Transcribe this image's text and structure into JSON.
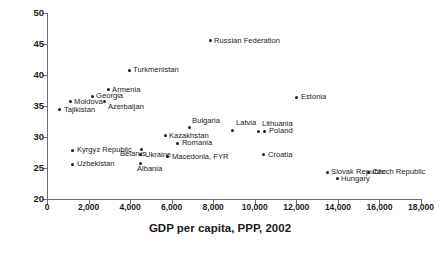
{
  "chart_data": {
    "type": "scatter",
    "title": "",
    "xlabel": "GDP per capita, PPP, 2002",
    "ylabel": "Gini",
    "xlim": [
      0,
      18000
    ],
    "ylim": [
      20,
      50
    ],
    "grid": false,
    "legend": "none",
    "xticks": [
      0,
      2000,
      4000,
      6000,
      8000,
      10000,
      12000,
      14000,
      16000,
      18000
    ],
    "xtick_labels": [
      "0",
      "2,000",
      "4,000",
      "6,000",
      "8,000",
      "10,000",
      "12,000",
      "14,000",
      "16,000",
      "18,000"
    ],
    "yticks": [
      20,
      25,
      30,
      35,
      40,
      45,
      50
    ],
    "ytick_labels": [
      "20",
      "25",
      "30",
      "35",
      "40",
      "45",
      "50"
    ],
    "points": [
      {
        "name": "Russian Federation",
        "x": 7850,
        "y": 45.5,
        "label_pos": "right"
      },
      {
        "name": "Turkmenistan",
        "x": 3950,
        "y": 40.8,
        "label_pos": "right"
      },
      {
        "name": "Armenia",
        "x": 2940,
        "y": 37.6,
        "label_pos": "right"
      },
      {
        "name": "Georgia",
        "x": 2170,
        "y": 36.6,
        "label_pos": "right"
      },
      {
        "name": "Azerbaijan",
        "x": 2790,
        "y": 35.8,
        "label_pos": "below-right"
      },
      {
        "name": "Moldova",
        "x": 1110,
        "y": 35.7,
        "label_pos": "right"
      },
      {
        "name": "Tajikistan",
        "x": 620,
        "y": 34.4,
        "label_pos": "right"
      },
      {
        "name": "Estonia",
        "x": 12030,
        "y": 36.4,
        "label_pos": "right"
      },
      {
        "name": "Bulgaria",
        "x": 6840,
        "y": 31.5,
        "label_pos": "above-right"
      },
      {
        "name": "Latvia",
        "x": 8950,
        "y": 31.1,
        "label_pos": "above-right"
      },
      {
        "name": "Lithuania",
        "x": 10200,
        "y": 30.9,
        "label_pos": "above-right"
      },
      {
        "name": "Poland",
        "x": 10490,
        "y": 30.9,
        "label_pos": "right"
      },
      {
        "name": "Kazakhstan",
        "x": 5680,
        "y": 30.2,
        "label_pos": "right"
      },
      {
        "name": "Romania",
        "x": 6300,
        "y": 29.0,
        "label_pos": "right"
      },
      {
        "name": "Belarus",
        "x": 4570,
        "y": 28.0,
        "label_pos": "left-below"
      },
      {
        "name": "Kyrgyz Republic",
        "x": 1250,
        "y": 27.9,
        "label_pos": "right"
      },
      {
        "name": "Croatia",
        "x": 10440,
        "y": 27.1,
        "label_pos": "right"
      },
      {
        "name": "Ukraine",
        "x": 4520,
        "y": 27.1,
        "label_pos": "right"
      },
      {
        "name": "Macedonia, FYR",
        "x": 5820,
        "y": 26.8,
        "label_pos": "right"
      },
      {
        "name": "Albania",
        "x": 4520,
        "y": 25.8,
        "label_pos": "below"
      },
      {
        "name": "Uzbekistan",
        "x": 1250,
        "y": 25.6,
        "label_pos": "right"
      },
      {
        "name": "Slovak Republic",
        "x": 13480,
        "y": 24.3,
        "label_pos": "right"
      },
      {
        "name": "Czech Republic",
        "x": 15460,
        "y": 24.3,
        "label_pos": "right"
      },
      {
        "name": "Hungary",
        "x": 13960,
        "y": 23.3,
        "label_pos": "right"
      }
    ]
  },
  "style": {
    "marker_color": "#1a1a1a",
    "axis_color": "#6e6e6e",
    "text_color": "#1a1a1a",
    "background": "#ffffff"
  }
}
